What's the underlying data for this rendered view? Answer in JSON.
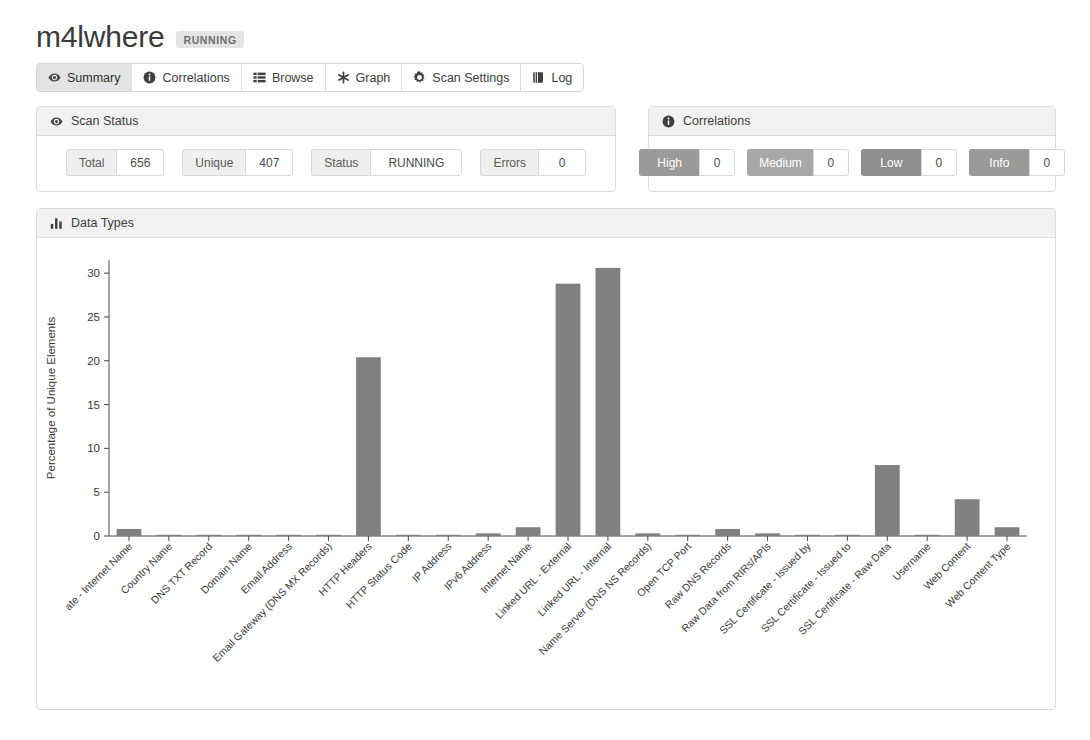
{
  "header": {
    "scan_name": "m4lwhere",
    "status_badge": "RUNNING"
  },
  "tabs": [
    {
      "label": "Summary",
      "icon": "eye-icon",
      "active": true
    },
    {
      "label": "Correlations",
      "icon": "info-icon",
      "active": false
    },
    {
      "label": "Browse",
      "icon": "list-icon",
      "active": false
    },
    {
      "label": "Graph",
      "icon": "asterisk-icon",
      "active": false
    },
    {
      "label": "Scan Settings",
      "icon": "gear-icon",
      "active": false
    },
    {
      "label": "Log",
      "icon": "book-icon",
      "active": false
    }
  ],
  "scan_status": {
    "panel_title": "Scan Status",
    "panel_icon": "eye-icon",
    "stats": [
      {
        "label": "Total",
        "value": "656"
      },
      {
        "label": "Unique",
        "value": "407"
      },
      {
        "label": "Status",
        "value": "RUNNING"
      },
      {
        "label": "Errors",
        "value": "0"
      }
    ]
  },
  "correlations": {
    "panel_title": "Correlations",
    "panel_icon": "info-icon",
    "severities": [
      {
        "label": "High",
        "value": "0",
        "color": "#9a9a9a"
      },
      {
        "label": "Medium",
        "value": "0",
        "color": "#a8a8a8"
      },
      {
        "label": "Low",
        "value": "0",
        "color": "#8e8e8e"
      },
      {
        "label": "Info",
        "value": "0",
        "color": "#9a9a9a"
      }
    ]
  },
  "data_types": {
    "panel_title": "Data Types",
    "panel_icon": "bar-chart-icon"
  },
  "chart_data": {
    "type": "bar",
    "title": "Data Types",
    "xlabel": "",
    "ylabel": "Percentage of Unique Elements",
    "ylim": [
      0,
      31.5
    ],
    "yticks": [
      0,
      5,
      10,
      15,
      20,
      25,
      30
    ],
    "grid": false,
    "legend": false,
    "bar_color": "#808080",
    "categories": [
      "ate - Internet Name",
      "Country Name",
      "DNS TXT Record",
      "Domain Name",
      "Email Address",
      "Email Gateway (DNS MX Records)",
      "HTTP Headers",
      "HTTP Status Code",
      "IP Address",
      "IPv6 Address",
      "Internet Name",
      "Linked URL - External",
      "Linked URL - Internal",
      "Name Server (DNS NS Records)",
      "Open TCP Port",
      "Raw DNS Records",
      "Raw Data from RIRs/APIs",
      "SSL Certificate - Issued by",
      "SSL Certificate - Issued to",
      "SSL Certificate - Raw Data",
      "Username",
      "Web Content",
      "Web Content Type"
    ],
    "values": [
      0.8,
      0.1,
      0.1,
      0.1,
      0.1,
      0.1,
      20.4,
      0.1,
      0.1,
      0.3,
      1.0,
      28.8,
      30.6,
      0.3,
      0.1,
      0.8,
      0.3,
      0.1,
      0.1,
      8.1,
      0.1,
      4.2,
      1.0
    ]
  }
}
